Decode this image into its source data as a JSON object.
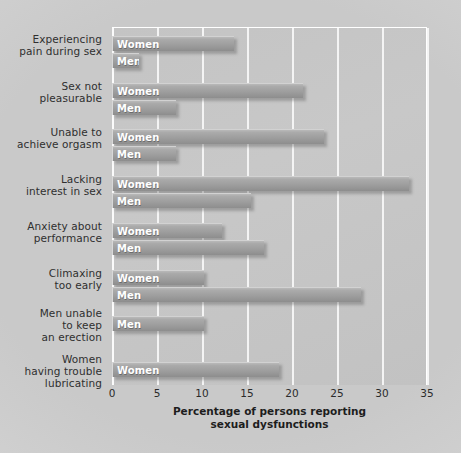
{
  "chart_data": {
    "type": "bar",
    "orientation": "horizontal",
    "title": "",
    "xlabel": "Percentage of persons reporting sexual dysfunctions",
    "ylabel": "",
    "xlim": [
      0,
      35
    ],
    "xticks": [
      0,
      5,
      10,
      15,
      20,
      25,
      30,
      35
    ],
    "grid": true,
    "legend": "inline-bar-labels",
    "categories": [
      "Experiencing pain during sex",
      "Sex not pleasurable",
      "Unable to achieve orgasm",
      "Lacking interest in sex",
      "Anxiety about performance",
      "Climaxing too early",
      "Men unable to keep an erection",
      "Women having trouble lubricating"
    ],
    "series": [
      {
        "name": "Women",
        "values": [
          13.6,
          21.2,
          23.5,
          33.0,
          12.2,
          10.2,
          null,
          18.6
        ]
      },
      {
        "name": "Men",
        "values": [
          3.0,
          7.1,
          7.1,
          15.4,
          16.9,
          27.7,
          10.2,
          null
        ]
      }
    ]
  },
  "axis": {
    "tick_labels": [
      "0",
      "5",
      "10",
      "15",
      "20",
      "25",
      "30",
      "35"
    ],
    "title_line1": "Percentage of persons reporting",
    "title_line2": "sexual dysfunctions"
  },
  "categories": [
    {
      "id": "pain-during-sex",
      "lines": [
        "Experiencing",
        "pain during sex"
      ]
    },
    {
      "id": "sex-not-pleasurable",
      "lines": [
        "Sex not",
        "pleasurable"
      ]
    },
    {
      "id": "unable-orgasm",
      "lines": [
        "Unable to",
        "achieve orgasm"
      ]
    },
    {
      "id": "lacking-interest",
      "lines": [
        "Lacking",
        "interest in sex"
      ]
    },
    {
      "id": "anxiety-performance",
      "lines": [
        "Anxiety about",
        "performance"
      ]
    },
    {
      "id": "climaxing-too-early",
      "lines": [
        "Climaxing",
        "too early"
      ]
    },
    {
      "id": "erection-trouble",
      "lines": [
        "Men unable",
        "to keep",
        "an erection"
      ]
    },
    {
      "id": "lubrication-trouble",
      "lines": [
        "Women",
        "having trouble",
        "lubricating"
      ]
    }
  ],
  "series_labels": {
    "women": "Women",
    "men": "Men"
  },
  "colors": {
    "plot_background": "#c5c5c5",
    "bar_fill": "#9e9e9e",
    "bar_highlight": "#d2d2d2",
    "gridline": "#f4f4f4",
    "bar_label_text": "#ffffff",
    "category_text": "#2f2f2f",
    "axis_text": "#1d1d1d",
    "page_background": "#cccccc"
  }
}
